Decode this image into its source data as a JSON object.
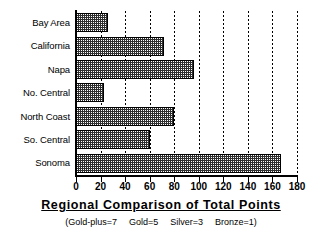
{
  "chart_data": {
    "type": "bar",
    "orientation": "horizontal",
    "title": "Regional Comparison of Total Points",
    "subtitle": "(Gold-plus=7   Gold=5   Silver=3   Bronze=1)",
    "subtitle_parts": [
      "(Gold-plus=7",
      "Gold=5",
      "Silver=3",
      "Bronze=1)"
    ],
    "xlabel": "",
    "ylabel": "",
    "categories": [
      "Bay Area",
      "California",
      "Napa",
      "No. Central",
      "North Coast",
      "So. Central",
      "Sonoma"
    ],
    "values": [
      26,
      72,
      96,
      23,
      80,
      60,
      167
    ],
    "xlim": [
      0,
      180
    ],
    "xticks": [
      0,
      20,
      40,
      60,
      80,
      100,
      120,
      140,
      160,
      180
    ],
    "xtick_labels": [
      "0",
      "20",
      "40",
      "60",
      "80",
      "100",
      "120",
      "140",
      "160",
      "180"
    ],
    "grid": "vertical-dotted",
    "legend": "none",
    "bar_fill": "#2e2e2e",
    "bar_edge": "#000000",
    "background": "#ffffff"
  }
}
